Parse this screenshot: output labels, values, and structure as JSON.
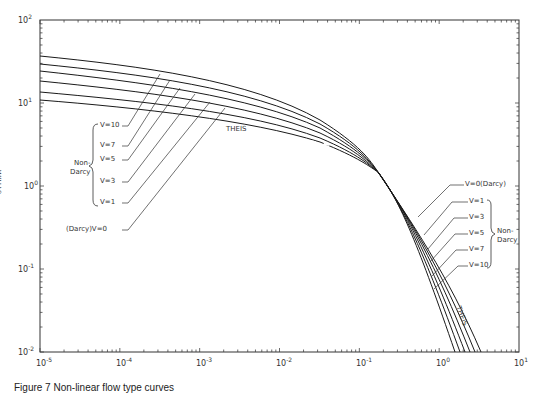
{
  "chart_data": {
    "type": "line",
    "title": "",
    "xlabel": "",
    "ylabel": "W(U,V)",
    "xscale": "log",
    "yscale": "log",
    "xlim": [
      1e-05,
      10
    ],
    "ylim": [
      0.01,
      100
    ],
    "x_tick_labels": [
      "10^-5",
      "10^-4",
      "10^-3",
      "10^-2",
      "10^-1",
      "10^0",
      "10^1"
    ],
    "y_tick_labels": [
      "10^-2",
      "10^-1",
      "10^0",
      "10^1",
      "10^2"
    ],
    "grid": false,
    "legend": "inline annotations",
    "series": [
      {
        "name": "V=0 (Darcy) / THEIS",
        "points": [
          [
            1e-05,
            10.9
          ],
          [
            0.0001,
            8.6
          ],
          [
            0.001,
            6.3
          ],
          [
            0.01,
            4.0
          ],
          [
            0.1,
            1.8
          ],
          [
            1,
            0.22
          ],
          [
            3,
            0.01
          ]
        ]
      },
      {
        "name": "V=1",
        "points": [
          [
            1e-05,
            12.9
          ],
          [
            0.0001,
            10.4
          ],
          [
            0.001,
            7.7
          ],
          [
            0.01,
            4.8
          ],
          [
            0.1,
            1.85
          ],
          [
            1,
            0.16
          ],
          [
            2.6,
            0.01
          ]
        ]
      },
      {
        "name": "V=3",
        "points": [
          [
            1e-05,
            16.5
          ],
          [
            0.0001,
            13.2
          ],
          [
            0.001,
            9.6
          ],
          [
            0.01,
            5.7
          ],
          [
            0.1,
            1.9
          ],
          [
            1,
            0.12
          ],
          [
            2.3,
            0.01
          ]
        ]
      },
      {
        "name": "V=5",
        "points": [
          [
            1e-05,
            20.0
          ],
          [
            0.0001,
            15.8
          ],
          [
            0.001,
            11.2
          ],
          [
            0.01,
            6.4
          ],
          [
            0.1,
            1.95
          ],
          [
            1,
            0.09
          ],
          [
            2.0,
            0.01
          ]
        ]
      },
      {
        "name": "V=7",
        "points": [
          [
            1e-05,
            23.5
          ],
          [
            0.0001,
            18.2
          ],
          [
            0.001,
            12.6
          ],
          [
            0.01,
            7.0
          ],
          [
            0.1,
            2.0
          ],
          [
            1,
            0.07
          ],
          [
            1.8,
            0.01
          ]
        ]
      },
      {
        "name": "V=10",
        "points": [
          [
            1e-05,
            29.0
          ],
          [
            0.0001,
            22.0
          ],
          [
            0.001,
            14.8
          ],
          [
            0.01,
            7.9
          ],
          [
            0.1,
            2.05
          ],
          [
            1,
            0.05
          ],
          [
            1.6,
            0.01
          ]
        ]
      }
    ],
    "annotations": {
      "left_group": [
        "V=10",
        "V=7",
        "V=5",
        "V=3",
        "V=1",
        "(Darcy)V=0"
      ],
      "left_bracket": "Non-Darcy",
      "right_group": [
        "V=0(Darcy)",
        "V=1",
        "V=3",
        "V=5",
        "V=7",
        "V=10"
      ],
      "right_bracket": "Non-Darcy",
      "theis_upper": "THEIS",
      "theis_lower": "THEIS"
    }
  },
  "labels": {
    "y_axis": "W(U,V)",
    "x_ticks": [
      "10",
      "10",
      "10",
      "10",
      "10",
      "10",
      "10"
    ],
    "x_exps": [
      "-5",
      "-4",
      "-3",
      "-2",
      "-1",
      "0",
      "1"
    ],
    "y_ticks": [
      "10",
      "10",
      "10",
      "10",
      "10"
    ],
    "y_exps": [
      "2",
      "1",
      "0",
      "-1",
      "-2"
    ],
    "left": [
      "V=10",
      "V=7",
      "V=5",
      "V=3",
      "V=1",
      "(Darcy)V=0"
    ],
    "left_bracket": "Non-",
    "left_bracket2": "Darcy",
    "right": [
      "V=0(Darcy)",
      "V=1",
      "V=3",
      "V=5",
      "V=7",
      "V=10"
    ],
    "right_bracket": "Non-",
    "right_bracket2": "Darcy",
    "theis_upper": "THEIS",
    "theis_lower": "THEIS",
    "caption": "Figure 7  Non-linear flow type curves"
  }
}
